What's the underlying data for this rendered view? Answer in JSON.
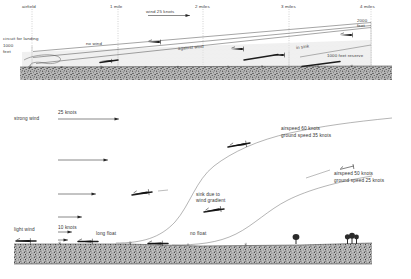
{
  "figure": {
    "accent_color": "#1d1d1d",
    "ground_color": "#6e6e6e"
  },
  "upper": {
    "name": "final-glide-diagram",
    "distance_markers": [
      {
        "label": "airfield",
        "x": 32
      },
      {
        "label": "1 mile",
        "x": 118
      },
      {
        "label": "2 miles",
        "x": 203
      },
      {
        "label": "3 miles",
        "x": 289
      },
      {
        "label": "4 miles",
        "x": 371
      }
    ],
    "wind_label": "wind 25 knots",
    "labels": {
      "circuit": "circuit for landing",
      "circuit_alt_1": "1000",
      "circuit_alt_2": "feet",
      "top_alt_1": "2000",
      "top_alt_2": "feet",
      "no_wind": "no wind",
      "against_wind": "against wind",
      "in_sink": "in sink",
      "reserve": "1000 feet reserve"
    }
  },
  "lower": {
    "name": "wind-gradient-approach-diagram",
    "wind_profile": {
      "strong_label": "strong wind",
      "light_label": "light wind",
      "top_speed": "25 knots",
      "bottom_speed": "10 knots"
    },
    "annotations": {
      "long_float": "long float",
      "no_float": "no float",
      "sink_line_1": "sink due to",
      "sink_line_2": "wind gradient",
      "fast_airspeed": "airspeed 60 knots",
      "fast_ground": "ground speed 35 knots",
      "slow_airspeed": "airspeed 50 knots",
      "slow_ground": "ground speed 25 knots"
    }
  }
}
